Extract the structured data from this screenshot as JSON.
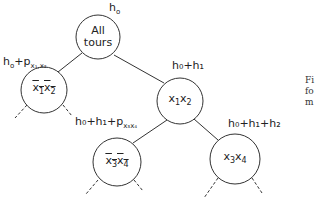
{
  "diagram": {
    "type": "branch-and-bound tree",
    "nodes": [
      {
        "id": "root",
        "text_line1": "All",
        "text_line2": "tours",
        "bound_label": {
          "base": "h",
          "sub": "o"
        }
      },
      {
        "id": "left",
        "text": {
          "v1": "x",
          "s1": "1",
          "v2": "x",
          "s2": "2"
        },
        "negated": true,
        "bound_label": {
          "prefix": "h",
          "prefix_sub": "o",
          "plus": "+p",
          "p_sub": "x₁,x₂"
        }
      },
      {
        "id": "right",
        "text": {
          "v1": "x",
          "s1": "1",
          "v2": "x",
          "s2": "2"
        },
        "negated": false,
        "bound_label": {
          "text": "h₀+h₁"
        }
      },
      {
        "id": "right-left",
        "text": {
          "v1": "x",
          "s1": "3",
          "v2": "x",
          "s2": "4"
        },
        "negated": true,
        "bound_label": {
          "text": "h₀+h₁+p",
          "p_sub": "x₃x₄"
        }
      },
      {
        "id": "right-right",
        "text": {
          "v1": "x",
          "s1": "3",
          "v2": "x",
          "s2": "4"
        },
        "negated": false,
        "bound_label": {
          "text": "h₀+h₁+h₂"
        }
      }
    ],
    "edges": [
      {
        "from": "root",
        "to": "left"
      },
      {
        "from": "root",
        "to": "right"
      },
      {
        "from": "right",
        "to": "right-left"
      },
      {
        "from": "right",
        "to": "right-right"
      }
    ]
  },
  "caption_fragment": [
    "Fi",
    "fo",
    "m"
  ]
}
